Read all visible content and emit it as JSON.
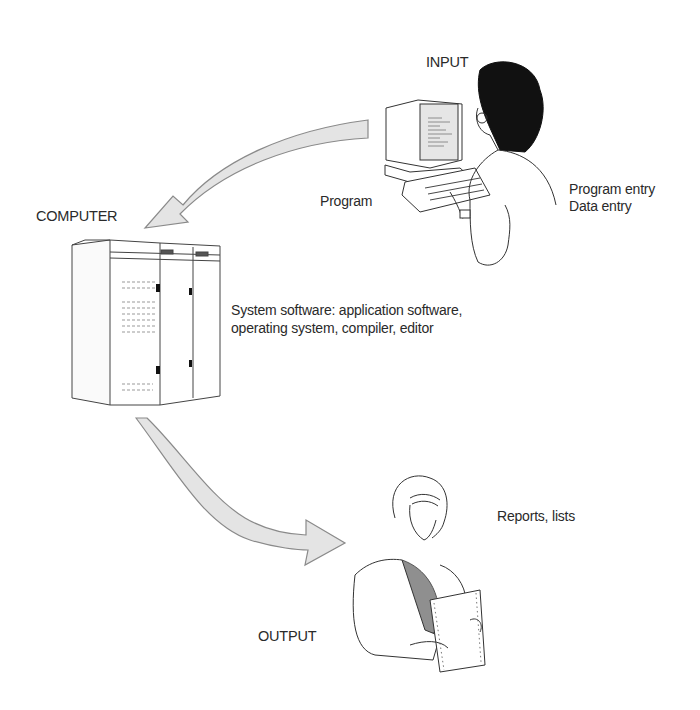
{
  "diagram": {
    "type": "process-cycle",
    "colors": {
      "arrow_fill": "#e4e4e4",
      "arrow_stroke": "#8a8a8a",
      "line": "#333333",
      "hair": "#111111",
      "shirt": "#8f8f8f"
    },
    "nodes": {
      "input": {
        "title": "INPUT",
        "caption_lines": [
          "Program entry",
          "Data entry"
        ],
        "figure": "person-at-computer-terminal"
      },
      "computer": {
        "title": "COMPUTER",
        "caption_lines": [
          "System software: application software,",
          "operating system, compiler, editor"
        ],
        "figure": "mainframe-cabinet"
      },
      "output": {
        "title": "OUTPUT",
        "caption_lines": [
          "Reports, lists"
        ],
        "figure": "woman-reading-printout"
      }
    },
    "edges": [
      {
        "from": "input",
        "to": "computer",
        "label": "Program",
        "icon": "curved-arrow-icon"
      },
      {
        "from": "computer",
        "to": "output",
        "label": "",
        "icon": "curved-arrow-icon"
      }
    ]
  }
}
